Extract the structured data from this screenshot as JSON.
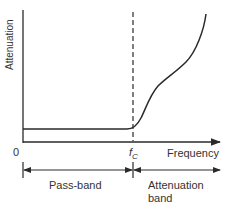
{
  "diagram": {
    "y_axis_label": "Attenuation",
    "x_axis_label": "Frequency",
    "origin_label": "0",
    "cutoff_label_main": "f",
    "cutoff_label_sub": "C",
    "bands": [
      {
        "label": "Pass-band"
      },
      {
        "label_line1": "Attenuation",
        "label_line2": "band"
      }
    ],
    "colors": {
      "line": "#2a2a2a",
      "background": "#ffffff"
    }
  }
}
